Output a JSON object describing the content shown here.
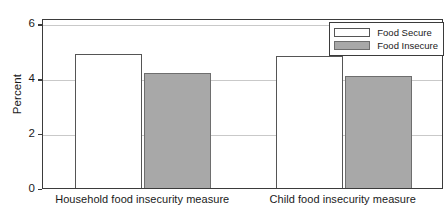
{
  "chart_data": {
    "type": "bar",
    "title": "",
    "xlabel": "",
    "ylabel": "Percent",
    "ylim": [
      0,
      6.2
    ],
    "yticks": [
      0,
      2,
      4,
      6
    ],
    "ytick_labels": [
      "0",
      "2",
      "4",
      "6"
    ],
    "grid": true,
    "legend_position": "top-right",
    "categories": [
      "Household food insecurity measure",
      "Child food insecurity measure"
    ],
    "series": [
      {
        "name": "Food Secure",
        "color": "#ffffff",
        "edge_color": "#555555",
        "values": [
          4.9,
          4.8
        ]
      },
      {
        "name": "Food Insecure",
        "color": "#a8a8a8",
        "edge_color": "#6e6e6e",
        "values": [
          4.2,
          4.1
        ]
      }
    ]
  },
  "legend": {
    "items": [
      {
        "label": "Food Secure",
        "swatch": "secure"
      },
      {
        "label": "Food Insecure",
        "swatch": "insecure"
      }
    ]
  },
  "axes": {
    "y_title": "Percent"
  }
}
